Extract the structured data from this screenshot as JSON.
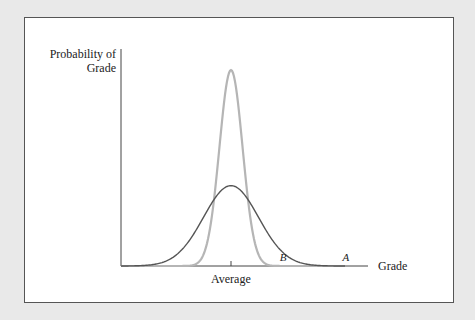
{
  "chart_data": {
    "type": "line",
    "title": "",
    "xlabel": "Grade",
    "ylabel": "Probability of Grade",
    "ylabel_lines": [
      "Probability of",
      "Grade"
    ],
    "x_ticks": [
      {
        "x": 0,
        "label": "Average"
      }
    ],
    "xlim": [
      -4,
      4.6
    ],
    "ylim": [
      0,
      1.05
    ],
    "grid": false,
    "series": [
      {
        "name": "A",
        "color": "#555555",
        "mean": 0,
        "sd": 1.0,
        "peak": 0.41,
        "label_x": 4.2
      },
      {
        "name": "B",
        "color": "#b5b5b5",
        "mean": 0,
        "sd": 0.42,
        "peak": 1.0,
        "label_x": 1.55
      }
    ]
  }
}
